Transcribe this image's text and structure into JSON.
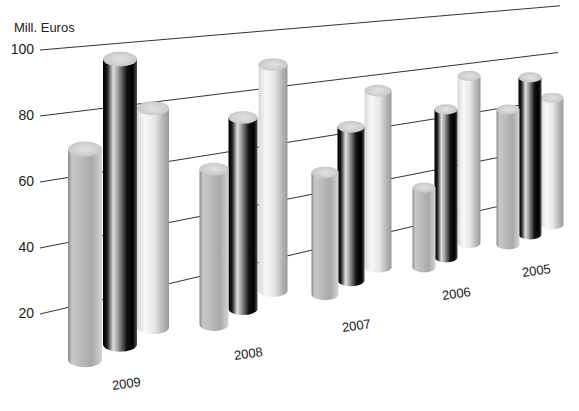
{
  "chart_data": {
    "type": "bar",
    "subtype": "3d-cylinder",
    "title": "",
    "xlabel": "",
    "ylabel": "Mill. Euros",
    "ylim": [
      0,
      100
    ],
    "yticks": [
      20,
      40,
      60,
      80,
      100
    ],
    "grid": true,
    "legend": null,
    "categories": [
      "2009",
      "2008",
      "2007",
      "2006",
      "2005"
    ],
    "series": [
      {
        "name": "Series 1 (light grey, front)",
        "color": "#b8b8b8",
        "values": [
          68,
          55,
          47,
          34,
          59
        ]
      },
      {
        "name": "Series 2 (black, middle)",
        "color": "#111111",
        "values": [
          95,
          71,
          62,
          63,
          71
        ]
      },
      {
        "name": "Series 3 (white, back)",
        "color": "#e8e8e8",
        "values": [
          78,
          88,
          74,
          75,
          61
        ]
      }
    ]
  },
  "axis": {
    "unit_label": "Mill. Euros",
    "ticks": [
      "20",
      "40",
      "60",
      "80",
      "100"
    ]
  },
  "colors": {
    "gridline": "#333333",
    "text": "#222222",
    "background": "#ffffff"
  }
}
